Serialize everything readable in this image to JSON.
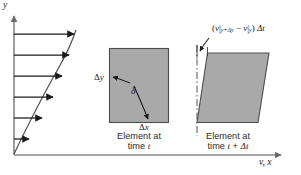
{
  "figure": {
    "background": "#ffffff",
    "ink_color": "#1a1a1a",
    "fill_color": "#a9a9a9",
    "fill_stroke": "#4d4d4d"
  },
  "axes": {
    "y_axis_label": "y",
    "x_axis_label": "v, x",
    "x_axis_label_parts": {
      "v": "v",
      "comma": ",",
      "x": "x"
    }
  },
  "velocity_profile": {
    "description": "Parabolic velocity profile with six horizontal arrows of increasing length with height",
    "arrow_count": 6,
    "arrows": [
      {
        "y": 34,
        "x_start": 14,
        "x_end": 74
      },
      {
        "y": 55,
        "x_start": 14,
        "x_end": 69
      },
      {
        "y": 76,
        "x_start": 14,
        "x_end": 62
      },
      {
        "y": 97,
        "x_start": 14,
        "x_end": 53
      },
      {
        "y": 118,
        "x_start": 14,
        "x_end": 42
      },
      {
        "y": 139,
        "x_start": 14,
        "x_end": 28
      }
    ]
  },
  "element_time_t": {
    "caption_line1": "Element at",
    "caption_line2_prefix": "time ",
    "caption_line2_var": "t",
    "delta_y_label": {
      "delta": "Δ",
      "var": "y"
    },
    "delta_x_label": {
      "delta": "Δ",
      "var": "x"
    },
    "angle_label": "δ"
  },
  "element_time_t_plus_dt": {
    "caption_line1": "Element at",
    "caption_line2_prefix": "time ",
    "caption_line2_var": "t",
    "caption_line2_plus": " + ",
    "caption_line2_delta": "Δt",
    "shear_label": {
      "open": "(",
      "v1": "v",
      "bar1": "|",
      "sub1": "y+Δy",
      "minus": " − ",
      "v2": "v",
      "bar2": "|",
      "sub2": "y",
      "close": ")",
      "dt": " Δt"
    }
  }
}
